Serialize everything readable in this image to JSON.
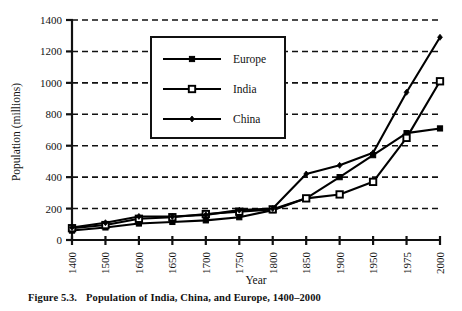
{
  "figure": {
    "caption_number": "Figure 5.3.",
    "caption_text": "Population of India, China, and Europe, 1400–2000"
  },
  "chart_data": {
    "type": "line",
    "title": "",
    "xlabel": "Year",
    "ylabel": "Population (millions)",
    "categories": [
      "1400",
      "1500",
      "1600",
      "1650",
      "1700",
      "1750",
      "1800",
      "1850",
      "1900",
      "1950",
      "1975",
      "2000"
    ],
    "x_tick_labels": [
      "1400",
      "1500",
      "1600",
      "1650",
      "1700",
      "1750",
      "1800",
      "1850",
      "1900",
      "1950",
      "1975",
      "2000"
    ],
    "y_tick_labels": [
      "0",
      "200",
      "400",
      "600",
      "800",
      "1000",
      "1200",
      "1400"
    ],
    "y_ticks": [
      0,
      200,
      400,
      600,
      800,
      1000,
      1200,
      1400
    ],
    "ylim": [
      0,
      1400
    ],
    "grid": "horizontal-dashed",
    "legend_position": "upper-center",
    "series": [
      {
        "name": "Europe",
        "marker": "filled-square",
        "color": "#000000",
        "values": [
          60,
          80,
          105,
          115,
          125,
          145,
          190,
          265,
          400,
          540,
          680,
          710
        ]
      },
      {
        "name": "India",
        "marker": "open-square",
        "color": "#000000",
        "values": [
          75,
          95,
          135,
          145,
          165,
          180,
          195,
          265,
          290,
          370,
          650,
          1010
        ]
      },
      {
        "name": "China",
        "marker": "small-diamond",
        "color": "#000000",
        "values": [
          80,
          110,
          150,
          150,
          160,
          190,
          200,
          420,
          475,
          555,
          940,
          1290
        ]
      }
    ]
  }
}
